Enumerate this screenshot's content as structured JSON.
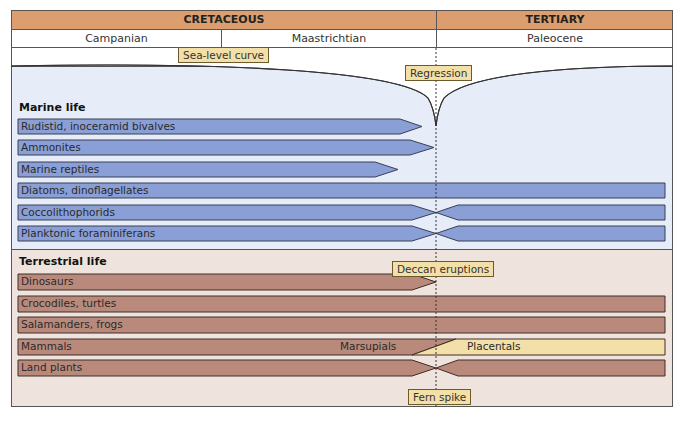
{
  "periods": [
    {
      "label": "CRETACEOUS",
      "x_start": 11,
      "x_end": 436
    },
    {
      "label": "TERTIARY",
      "x_start": 436,
      "x_end": 673
    }
  ],
  "stages": [
    {
      "label": "Campanian",
      "x_start": 11,
      "x_end": 221
    },
    {
      "label": "Maastrichtian",
      "x_start": 221,
      "x_end": 436
    },
    {
      "label": "Paleocene",
      "x_start": 436,
      "x_end": 673
    }
  ],
  "boundary_x": 436,
  "annotations": {
    "sea_level": "Sea-level curve",
    "regression": "Regression",
    "deccan": "Deccan eruptions",
    "fern_spike": "Fern spike"
  },
  "marine": {
    "title": "Marine life",
    "bars": [
      {
        "label": "Rudistid, inoceramid bivalves",
        "type": "arrow",
        "end": 400,
        "tip": 422
      },
      {
        "label": "Ammonites",
        "type": "arrow",
        "end": 410,
        "tip": 434
      },
      {
        "label": "Marine reptiles",
        "type": "arrow",
        "end": 375,
        "tip": 398
      },
      {
        "label": "Diatoms, dinoflagellates",
        "type": "full"
      },
      {
        "label": "Coccolithophorids",
        "type": "bottleneck"
      },
      {
        "label": "Planktonic foraminiferans",
        "type": "bottleneck"
      }
    ]
  },
  "terrestrial": {
    "title": "Terrestrial life",
    "bars": [
      {
        "label": "Dinosaurs",
        "type": "arrow",
        "end": 412,
        "tip": 436
      },
      {
        "label": "Crocodiles, turtles",
        "type": "full"
      },
      {
        "label": "Salamanders, frogs",
        "type": "full"
      },
      {
        "label": "Mammals",
        "type": "transition",
        "left_label": "Marsupials",
        "right_label": "Placentals"
      },
      {
        "label": "Land plants",
        "type": "bottleneck"
      }
    ]
  },
  "colors": {
    "period_header": "#dc9e6e",
    "marine_bg": "#e7edf8",
    "terrestrial_bg": "#efe4dd",
    "marine_bar": "#8a9fd6",
    "terrestrial_bar": "#b98a7c",
    "placental_bar": "#f3e0a8",
    "tag_bg": "#f3e0a8"
  }
}
